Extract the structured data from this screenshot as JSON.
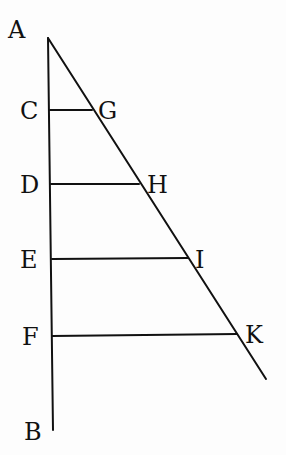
{
  "diagram": {
    "ink_color": "#111111",
    "background_color": "#fdfdfd",
    "points": {
      "A": {
        "label": "A",
        "x": 48,
        "y": 38
      },
      "B": {
        "label": "B",
        "x": 53,
        "y": 430
      },
      "C": {
        "label": "C",
        "x": 50,
        "y": 110
      },
      "D": {
        "label": "D",
        "x": 51,
        "y": 184
      },
      "E": {
        "label": "E",
        "x": 52,
        "y": 259
      },
      "F": {
        "label": "F",
        "x": 52,
        "y": 336
      },
      "G": {
        "label": "G",
        "x": 92,
        "y": 110
      },
      "H": {
        "label": "H",
        "x": 139,
        "y": 184
      },
      "I": {
        "label": "I",
        "x": 188,
        "y": 259
      },
      "K": {
        "label": "K",
        "x": 237,
        "y": 334
      }
    },
    "segments": [
      {
        "name": "AB",
        "from": "A",
        "to": "B"
      },
      {
        "name": "A-diagonal",
        "from": "A",
        "to": "end"
      },
      {
        "name": "CG",
        "from": "C",
        "to": "G"
      },
      {
        "name": "DH",
        "from": "D",
        "to": "H"
      },
      {
        "name": "EI",
        "from": "E",
        "to": "I"
      },
      {
        "name": "FK",
        "from": "F",
        "to": "K"
      }
    ]
  }
}
